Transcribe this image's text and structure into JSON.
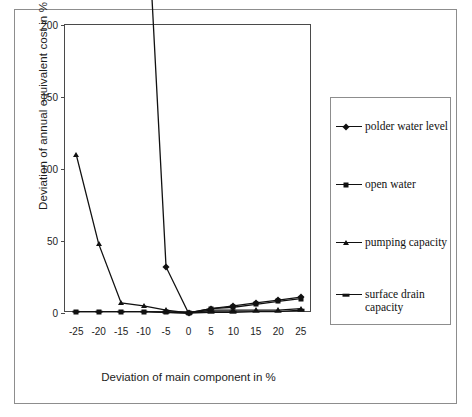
{
  "chart_data": {
    "type": "line",
    "title": "",
    "xlabel": "Deviation of main component in %",
    "ylabel": "Deviation of annual equivalent cost in %",
    "x": [
      -25,
      -20,
      -15,
      -10,
      -5,
      0,
      5,
      10,
      15,
      20,
      25
    ],
    "xticks": [
      "-25",
      "-20",
      "-15",
      "-10",
      "-5",
      "0",
      "5",
      "10",
      "15",
      "20",
      "25"
    ],
    "yticks": [
      "0",
      "50",
      "100",
      "150",
      "200"
    ],
    "ytickvals": [
      0,
      50,
      100,
      150,
      200
    ],
    "xlim": [
      -27.5,
      27.5
    ],
    "ylim": [
      0,
      200
    ],
    "grid": false,
    "legend_position": "right",
    "series": [
      {
        "name": "polder water level",
        "marker": "diamond",
        "values": [
          null,
          null,
          null,
          330,
          32,
          0,
          3,
          5,
          7,
          9,
          11
        ],
        "clipped_above": true
      },
      {
        "name": "open water",
        "marker": "square",
        "values": [
          1,
          1,
          1,
          1,
          0.5,
          0,
          3,
          4,
          6,
          8,
          10
        ]
      },
      {
        "name": "pumping capacity",
        "marker": "triangle",
        "values": [
          110,
          48,
          7,
          5,
          2,
          0,
          2,
          2,
          2,
          2,
          3
        ]
      },
      {
        "name": "surface drain capacity",
        "marker": "dash",
        "values": [
          1,
          1,
          1,
          1,
          0.5,
          0,
          0.5,
          0.5,
          1,
          1,
          2
        ]
      }
    ]
  },
  "legend": {
    "entries": [
      {
        "label": "polder water level",
        "marker": "diamond"
      },
      {
        "label": "open water",
        "marker": "square"
      },
      {
        "label": "pumping capacity",
        "marker": "triangle"
      },
      {
        "label": "surface drain capacity",
        "marker": "dash"
      }
    ]
  },
  "colors": {
    "line": "#111111",
    "axis": "#4a4a4a",
    "frame": "#8d8d8d",
    "text": "#1d1d1d",
    "background": "#ffffff"
  }
}
